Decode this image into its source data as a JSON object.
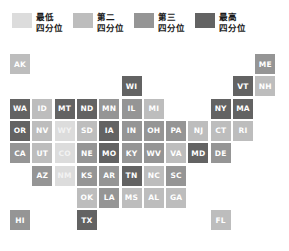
{
  "legend": {
    "title": "",
    "items": [
      {
        "label_line1": "最低",
        "label_line2": "四分位",
        "color": "#dcdcdc",
        "quartile": 1
      },
      {
        "label_line1": "第二",
        "label_line2": "四分位",
        "color": "#bdbdbd",
        "quartile": 2
      },
      {
        "label_line1": "第三",
        "label_line2": "四分位",
        "color": "#959595",
        "quartile": 3
      },
      {
        "label_line1": "最高",
        "label_line2": "四分位",
        "color": "#636363",
        "quartile": 4
      }
    ]
  },
  "chart_data": {
    "type": "heatmap",
    "title": "",
    "subtitle": "",
    "xlabel": "",
    "ylabel": "",
    "grid": false,
    "legend_position": "top",
    "palette": [
      "#dcdcdc",
      "#bdbdbd",
      "#959595",
      "#636363"
    ],
    "quartile_labels": [
      "最低四分位",
      "第二四分位",
      "第三四分位",
      "最高四分位"
    ],
    "grid_cols": 12,
    "grid_rows": 9,
    "tile_size": 20,
    "tile_pitch": 22.3,
    "categories": [
      "AK",
      "ME",
      "WI",
      "VT",
      "NH",
      "WA",
      "ID",
      "MT",
      "ND",
      "MN",
      "IL",
      "MI",
      "NY",
      "MA",
      "OR",
      "NV",
      "WY",
      "SD",
      "IA",
      "IN",
      "OH",
      "PA",
      "NJ",
      "CT",
      "RI",
      "CA",
      "UT",
      "CO",
      "NE",
      "MO",
      "KY",
      "WV",
      "VA",
      "MD",
      "DE",
      "AZ",
      "NM",
      "KS",
      "AR",
      "TN",
      "NC",
      "SC",
      "OK",
      "LA",
      "MS",
      "AL",
      "GA",
      "HI",
      "TX",
      "FL"
    ],
    "values": [
      2,
      3,
      4,
      4,
      2,
      4,
      2,
      4,
      4,
      3,
      3,
      2,
      4,
      4,
      4,
      2,
      1,
      2,
      4,
      3,
      3,
      3,
      2,
      2,
      2,
      3,
      2,
      1,
      3,
      4,
      3,
      3,
      2,
      4,
      3,
      3,
      1,
      3,
      3,
      4,
      2,
      3,
      2,
      3,
      2,
      2,
      2,
      3,
      4,
      2
    ],
    "states": [
      {
        "code": "AK",
        "row": 0,
        "col": 0,
        "quartile": 2
      },
      {
        "code": "ME",
        "row": 0,
        "col": 11,
        "quartile": 3
      },
      {
        "code": "WI",
        "row": 1,
        "col": 5,
        "quartile": 4
      },
      {
        "code": "VT",
        "row": 1,
        "col": 10,
        "quartile": 4
      },
      {
        "code": "NH",
        "row": 1,
        "col": 11,
        "quartile": 2
      },
      {
        "code": "WA",
        "row": 2,
        "col": 0,
        "quartile": 4
      },
      {
        "code": "ID",
        "row": 2,
        "col": 1,
        "quartile": 2
      },
      {
        "code": "MT",
        "row": 2,
        "col": 2,
        "quartile": 4
      },
      {
        "code": "ND",
        "row": 2,
        "col": 3,
        "quartile": 4
      },
      {
        "code": "MN",
        "row": 2,
        "col": 4,
        "quartile": 3
      },
      {
        "code": "IL",
        "row": 2,
        "col": 5,
        "quartile": 3
      },
      {
        "code": "MI",
        "row": 2,
        "col": 6,
        "quartile": 2
      },
      {
        "code": "NY",
        "row": 2,
        "col": 9,
        "quartile": 4
      },
      {
        "code": "MA",
        "row": 2,
        "col": 10,
        "quartile": 4
      },
      {
        "code": "OR",
        "row": 3,
        "col": 0,
        "quartile": 4
      },
      {
        "code": "NV",
        "row": 3,
        "col": 1,
        "quartile": 2
      },
      {
        "code": "WY",
        "row": 3,
        "col": 2,
        "quartile": 1
      },
      {
        "code": "SD",
        "row": 3,
        "col": 3,
        "quartile": 2
      },
      {
        "code": "IA",
        "row": 3,
        "col": 4,
        "quartile": 4
      },
      {
        "code": "IN",
        "row": 3,
        "col": 5,
        "quartile": 3
      },
      {
        "code": "OH",
        "row": 3,
        "col": 6,
        "quartile": 3
      },
      {
        "code": "PA",
        "row": 3,
        "col": 7,
        "quartile": 3
      },
      {
        "code": "NJ",
        "row": 3,
        "col": 8,
        "quartile": 2
      },
      {
        "code": "CT",
        "row": 3,
        "col": 9,
        "quartile": 2
      },
      {
        "code": "RI",
        "row": 3,
        "col": 10,
        "quartile": 2
      },
      {
        "code": "CA",
        "row": 4,
        "col": 0,
        "quartile": 3
      },
      {
        "code": "UT",
        "row": 4,
        "col": 1,
        "quartile": 2
      },
      {
        "code": "CO",
        "row": 4,
        "col": 2,
        "quartile": 1
      },
      {
        "code": "NE",
        "row": 4,
        "col": 3,
        "quartile": 3
      },
      {
        "code": "MO",
        "row": 4,
        "col": 4,
        "quartile": 4
      },
      {
        "code": "KY",
        "row": 4,
        "col": 5,
        "quartile": 3
      },
      {
        "code": "WV",
        "row": 4,
        "col": 6,
        "quartile": 3
      },
      {
        "code": "VA",
        "row": 4,
        "col": 7,
        "quartile": 2
      },
      {
        "code": "MD",
        "row": 4,
        "col": 8,
        "quartile": 4
      },
      {
        "code": "DE",
        "row": 4,
        "col": 9,
        "quartile": 3
      },
      {
        "code": "AZ",
        "row": 5,
        "col": 1,
        "quartile": 3
      },
      {
        "code": "NM",
        "row": 5,
        "col": 2,
        "quartile": 1
      },
      {
        "code": "KS",
        "row": 5,
        "col": 3,
        "quartile": 3
      },
      {
        "code": "AR",
        "row": 5,
        "col": 4,
        "quartile": 3
      },
      {
        "code": "TN",
        "row": 5,
        "col": 5,
        "quartile": 4
      },
      {
        "code": "NC",
        "row": 5,
        "col": 6,
        "quartile": 2
      },
      {
        "code": "SC",
        "row": 5,
        "col": 7,
        "quartile": 3
      },
      {
        "code": "OK",
        "row": 6,
        "col": 3,
        "quartile": 2
      },
      {
        "code": "LA",
        "row": 6,
        "col": 4,
        "quartile": 3
      },
      {
        "code": "MS",
        "row": 6,
        "col": 5,
        "quartile": 2
      },
      {
        "code": "AL",
        "row": 6,
        "col": 6,
        "quartile": 2
      },
      {
        "code": "GA",
        "row": 6,
        "col": 7,
        "quartile": 2
      },
      {
        "code": "HI",
        "row": 7,
        "col": 0,
        "quartile": 3
      },
      {
        "code": "TX",
        "row": 7,
        "col": 3,
        "quartile": 4
      },
      {
        "code": "FL",
        "row": 7,
        "col": 9,
        "quartile": 2
      }
    ]
  }
}
